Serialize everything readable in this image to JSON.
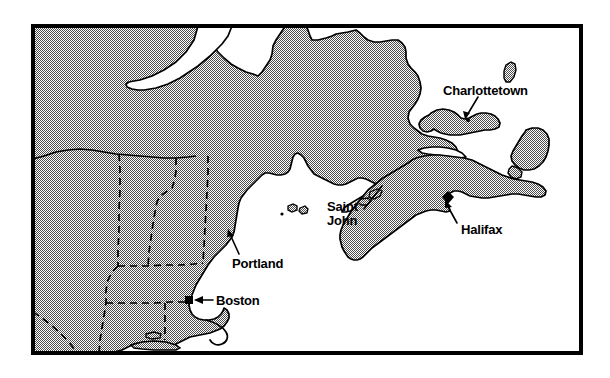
{
  "map": {
    "title": "Northeastern United States and Atlantic Canada reference map",
    "frame": {
      "border_color": "#000000",
      "border_width_px": 4,
      "x": 31,
      "y": 24,
      "width": 552,
      "height": 331
    },
    "style": {
      "land_fill_pattern": "halftone-dither-gray",
      "land_fill_color": "#9a9a9a",
      "water_fill_color": "#ffffff",
      "coastline_color": "#000000",
      "state_border_style": "dashed",
      "state_border_color": "#000000",
      "label_color": "#000000",
      "marker_color": "#000000"
    },
    "labels": [
      {
        "id": "charlottetown",
        "name": "Charlottetown",
        "text": "Charlottetown",
        "x": 443,
        "y": 84,
        "lines": [
          "Charlottetown"
        ],
        "marker": "none",
        "leader": true
      },
      {
        "id": "saint-john",
        "name": "Saint John",
        "text": "Saint John",
        "x": 327,
        "y": 200,
        "lines": [
          "Saint",
          "John"
        ],
        "marker": "none",
        "leader": true
      },
      {
        "id": "halifax",
        "name": "Halifax",
        "text": "Halifax",
        "x": 461,
        "y": 223,
        "lines": [
          "Halifax"
        ],
        "marker": "dot",
        "leader": true
      },
      {
        "id": "portland",
        "name": "Portland",
        "text": "Portland",
        "x": 232,
        "y": 257,
        "lines": [
          "Portland"
        ],
        "marker": "none",
        "leader": true
      },
      {
        "id": "boston",
        "name": "Boston",
        "text": "Boston",
        "x": 216,
        "y": 294,
        "lines": [
          "Boston"
        ],
        "marker": "square",
        "leader": true
      }
    ],
    "markers": [
      {
        "id": "halifax-marker",
        "name": "Halifax",
        "shape": "dot",
        "x": 448,
        "y": 197,
        "size": 7
      },
      {
        "id": "boston-marker",
        "name": "Boston",
        "shape": "square",
        "x": 189,
        "y": 300,
        "size": 7
      },
      {
        "id": "charlottetown-marker",
        "name": "Charlottetown",
        "shape": "dot",
        "x": 471,
        "y": 113,
        "size": 4
      }
    ]
  }
}
